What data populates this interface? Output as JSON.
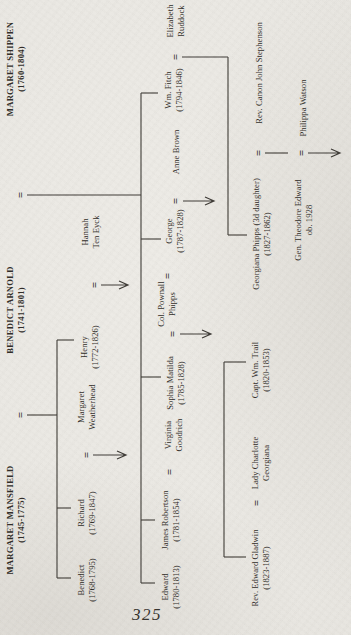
{
  "page": {
    "number": "325"
  },
  "colors": {
    "paper": "#e9e7e2",
    "ink": "#2e2b26",
    "line": "#3c3934"
  },
  "tree": {
    "people": [
      {
        "id": "margaret-mansfield",
        "x": 115,
        "y": 5,
        "bold": true,
        "lines": [
          "MARGARET MANSFIELD",
          "(1745-1775)"
        ]
      },
      {
        "id": "benedict-arnold",
        "x": 325,
        "y": 5,
        "bold": true,
        "lines": [
          "BENEDICT ARNOLD",
          "(1741-1801)"
        ]
      },
      {
        "id": "margaret-shippen",
        "x": 566,
        "y": 5,
        "bold": true,
        "lines": [
          "MARGARET SHIPPEN",
          "(1760-1804)"
        ]
      },
      {
        "id": "benedict-jr",
        "x": 55,
        "y": 76,
        "bold": false,
        "lines": [
          "Benedict",
          "(1768-1795)"
        ]
      },
      {
        "id": "richard",
        "x": 122,
        "y": 76,
        "bold": false,
        "lines": [
          "Richard",
          "(1769-1847)"
        ]
      },
      {
        "id": "margaret-weatherhead",
        "x": 228,
        "y": 76,
        "bold": false,
        "lines": [
          "Margaret",
          "Weatherhead"
        ]
      },
      {
        "id": "henry",
        "x": 288,
        "y": 79,
        "bold": false,
        "lines": [
          "Henry",
          "(1772-1826)"
        ]
      },
      {
        "id": "hannah-ten-eyck",
        "x": 403,
        "y": 80,
        "bold": false,
        "lines": [
          "Hannah",
          "Ten Eyck"
        ]
      },
      {
        "id": "edward",
        "x": 48,
        "y": 160,
        "bold": false,
        "lines": [
          "Edward",
          "(1780-1813)"
        ]
      },
      {
        "id": "james-robertson",
        "x": 115,
        "y": 160,
        "bold": false,
        "lines": [
          "James Robertson",
          "(1781-1854)"
        ]
      },
      {
        "id": "virginia-goodrich",
        "x": 200,
        "y": 163,
        "bold": false,
        "lines": [
          "Virginia",
          "Goodrich"
        ]
      },
      {
        "id": "sophia-matilda",
        "x": 252,
        "y": 165,
        "bold": false,
        "lines": [
          "Sophia Matilda",
          "(1785-1828)"
        ]
      },
      {
        "id": "col-pownall-phipps",
        "x": 331,
        "y": 156,
        "bold": false,
        "lines": [
          "Col. Pownall",
          "Phipps"
        ]
      },
      {
        "id": "george",
        "x": 404,
        "y": 164,
        "bold": false,
        "lines": [
          "George",
          "(1787-1828)"
        ]
      },
      {
        "id": "anne-brown",
        "x": 483,
        "y": 171,
        "bold": false,
        "lines": [
          "Anne Brown"
        ]
      },
      {
        "id": "wm-fitch",
        "x": 545,
        "y": 163,
        "bold": false,
        "lines": [
          "Wm. Fitch",
          "(1794-1846)"
        ]
      },
      {
        "id": "elizabeth-ruddock",
        "x": 614,
        "y": 165,
        "bold": false,
        "lines": [
          "Elizabeth",
          "Ruddock"
        ]
      },
      {
        "id": "rev-edward-gladwin",
        "x": 67,
        "y": 250,
        "bold": false,
        "lines": [
          "Rev. Edward Gladwin",
          "(1823-1887)"
        ]
      },
      {
        "id": "lady-charlotte-georgiana",
        "x": 172,
        "y": 250,
        "bold": false,
        "lines": [
          "Lady Charlotte",
          "Georgiana"
        ]
      },
      {
        "id": "capt-wm-trail",
        "x": 265,
        "y": 250,
        "bold": false,
        "lines": [
          "Capt. Wm. Trail",
          "(1820-1853)"
        ]
      },
      {
        "id": "georgiana-phipps",
        "x": 401,
        "y": 251,
        "bold": false,
        "lines": [
          "Georgiana Phipps (3d daughter)",
          "(1827-1862)"
        ]
      },
      {
        "id": "rev-canon-john-stephenson",
        "x": 562,
        "y": 254,
        "bold": false,
        "lines": [
          "Rev. Canon John Stephenson"
        ]
      },
      {
        "id": "gen-theodore-edward",
        "x": 415,
        "y": 293,
        "bold": false,
        "lines": [
          "Gen. Theodore Edward",
          "ob. 1928"
        ]
      },
      {
        "id": "philippa-watson",
        "x": 527,
        "y": 298,
        "bold": false,
        "lines": [
          "Philippa Watson"
        ]
      }
    ],
    "unions": [
      {
        "id": "mansfield-arnold",
        "x": 220,
        "y": 21
      },
      {
        "id": "arnold-shippen",
        "x": 440,
        "y": 21
      },
      {
        "id": "richard-weatherhead",
        "x": 180,
        "y": 87
      },
      {
        "id": "henry-hannah",
        "x": 350,
        "y": 95
      },
      {
        "id": "james-virginia",
        "x": 163,
        "y": 170
      },
      {
        "id": "sophia-phipps",
        "x": 301,
        "y": 173
      },
      {
        "id": "extra-mark",
        "x": 359,
        "y": 168
      },
      {
        "id": "george-anne",
        "x": 434,
        "y": 176
      },
      {
        "id": "fitch-ruddock",
        "x": 578,
        "y": 176
      },
      {
        "id": "gladwin-charlotte",
        "x": 132,
        "y": 257
      },
      {
        "id": "georgiana-stephenson",
        "x": 482,
        "y": 259
      },
      {
        "id": "theodore-philippa",
        "x": 482,
        "y": 302
      }
    ],
    "segments": [
      [
        220,
        27,
        220,
        57
      ],
      [
        57,
        57,
        295,
        57
      ],
      [
        57,
        57,
        57,
        71
      ],
      [
        127,
        57,
        127,
        71
      ],
      [
        295,
        57,
        295,
        74
      ],
      [
        440,
        27,
        440,
        141
      ],
      [
        52,
        141,
        542,
        141
      ],
      [
        52,
        141,
        52,
        155
      ],
      [
        115,
        141,
        115,
        155
      ],
      [
        258,
        141,
        258,
        161
      ],
      [
        396,
        141,
        396,
        161
      ],
      [
        542,
        141,
        542,
        158
      ],
      [
        578,
        182,
        578,
        228
      ],
      [
        400,
        228,
        578,
        228
      ],
      [
        400,
        228,
        400,
        247
      ],
      [
        78,
        224,
        273,
        224
      ],
      [
        78,
        224,
        78,
        246
      ],
      [
        273,
        224,
        273,
        246
      ],
      [
        482,
        265,
        482,
        288
      ]
    ],
    "arrows": [
      {
        "x": 180,
        "y1": 93,
        "y2": 126
      },
      {
        "x": 350,
        "y1": 101,
        "y2": 128
      },
      {
        "x": 301,
        "y1": 180,
        "y2": 211
      },
      {
        "x": 434,
        "y1": 183,
        "y2": 214
      },
      {
        "x": 482,
        "y1": 308,
        "y2": 340
      }
    ]
  }
}
